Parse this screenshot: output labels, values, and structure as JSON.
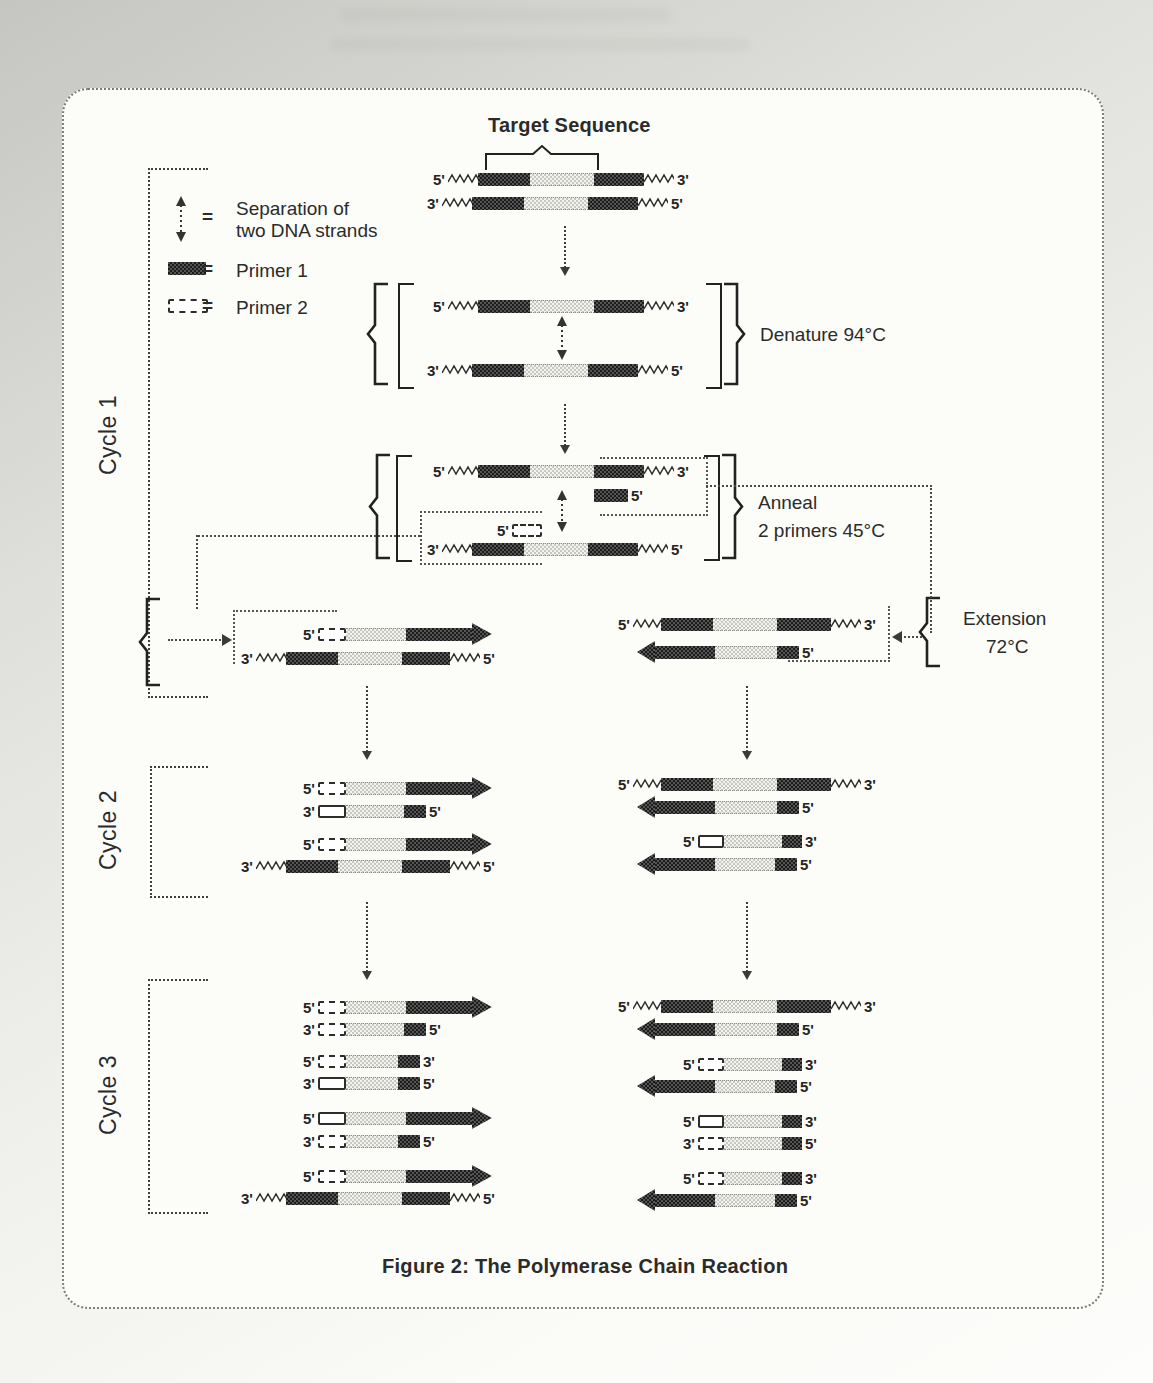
{
  "figure": {
    "target_label": "Target Sequence",
    "caption": "Figure 2: The Polymerase Chain Reaction",
    "cycles": [
      "Cycle 1",
      "Cycle 2",
      "Cycle 3"
    ],
    "steps": {
      "denature": "Denature 94°C",
      "anneal_line1": "Anneal",
      "anneal_line2": "2 primers 45°C",
      "extension_line1": "Extension",
      "extension_line2": "72°C"
    },
    "legend": {
      "equals": "=",
      "items": [
        {
          "icon": "separation-arrows-icon",
          "label_line1": "Separation of",
          "label_line2": "two DNA strands"
        },
        {
          "icon": "primer1-swatch",
          "label_line1": "Primer 1",
          "label_line2": ""
        },
        {
          "icon": "primer2-swatch",
          "label_line1": "Primer 2",
          "label_line2": ""
        }
      ]
    },
    "strand_end_labels": {
      "five_prime": "5'",
      "three_prime": "3'"
    },
    "colors": {
      "ink": "#2b2b2b",
      "dark_fill": "#1c1c1c",
      "dark_alt": "#555555",
      "light_fill": "#c8c8c3",
      "panel_bg": "#fcfcf9",
      "page_bg": "#c5c6c1"
    }
  },
  "strands": [
    {
      "x": 430,
      "y": 170,
      "parts": [
        [
          "lbl",
          "5'"
        ],
        [
          "zig",
          30
        ],
        [
          "dark",
          52
        ],
        [
          "light",
          64
        ],
        [
          "dark",
          50
        ],
        [
          "zig",
          30
        ],
        [
          "lbl",
          "3'"
        ]
      ]
    },
    {
      "x": 424,
      "y": 194,
      "parts": [
        [
          "lbl",
          "3'"
        ],
        [
          "zig",
          30
        ],
        [
          "dark",
          52
        ],
        [
          "light",
          64
        ],
        [
          "dark",
          50
        ],
        [
          "zig",
          30
        ],
        [
          "lbl",
          "5'"
        ]
      ]
    },
    {
      "x": 430,
      "y": 297,
      "parts": [
        [
          "lbl",
          "5'"
        ],
        [
          "zig",
          30
        ],
        [
          "dark",
          52
        ],
        [
          "light",
          64
        ],
        [
          "dark",
          50
        ],
        [
          "zig",
          30
        ],
        [
          "lbl",
          "3'"
        ]
      ]
    },
    {
      "x": 424,
      "y": 361,
      "parts": [
        [
          "lbl",
          "3'"
        ],
        [
          "zig",
          30
        ],
        [
          "dark",
          52
        ],
        [
          "light",
          64
        ],
        [
          "dark",
          50
        ],
        [
          "zig",
          30
        ],
        [
          "lbl",
          "5'"
        ]
      ]
    },
    {
      "x": 430,
      "y": 462,
      "parts": [
        [
          "lbl",
          "5'"
        ],
        [
          "zig",
          30
        ],
        [
          "dark",
          52
        ],
        [
          "light",
          64
        ],
        [
          "dark",
          50
        ],
        [
          "zig",
          30
        ],
        [
          "lbl",
          "3'"
        ]
      ]
    },
    {
      "x": 594,
      "y": 486,
      "parts": [
        [
          "p1",
          34
        ],
        [
          "lbl",
          "5'"
        ]
      ]
    },
    {
      "x": 494,
      "y": 521,
      "parts": [
        [
          "lbl",
          "5'"
        ],
        [
          "p2",
          26,
          "dashed"
        ]
      ]
    },
    {
      "x": 424,
      "y": 540,
      "parts": [
        [
          "lbl",
          "3'"
        ],
        [
          "zig",
          30
        ],
        [
          "dark",
          52
        ],
        [
          "light",
          64
        ],
        [
          "dark",
          50
        ],
        [
          "zig",
          30
        ],
        [
          "lbl",
          "5'"
        ]
      ]
    },
    {
      "x": 300,
      "y": 625,
      "parts": [
        [
          "lbl",
          "5'"
        ],
        [
          "p2",
          24,
          "dashed"
        ],
        [
          "light",
          60
        ],
        [
          "dark",
          66
        ],
        [
          "arrR",
          20
        ]
      ]
    },
    {
      "x": 238,
      "y": 649,
      "parts": [
        [
          "lbl",
          "3'"
        ],
        [
          "zig",
          30
        ],
        [
          "dark",
          52
        ],
        [
          "light",
          64
        ],
        [
          "dark",
          48
        ],
        [
          "zig",
          30
        ],
        [
          "lbl",
          "5'"
        ]
      ]
    },
    {
      "x": 615,
      "y": 615,
      "parts": [
        [
          "lbl",
          "5'"
        ],
        [
          "zig",
          28
        ],
        [
          "dark",
          52
        ],
        [
          "light",
          64
        ],
        [
          "dark",
          54
        ],
        [
          "zig",
          30
        ],
        [
          "lbl",
          "3'"
        ]
      ]
    },
    {
      "x": 637,
      "y": 643,
      "parts": [
        [
          "arrL",
          18
        ],
        [
          "dark",
          60
        ],
        [
          "light",
          62
        ],
        [
          "p1",
          22
        ],
        [
          "lbl",
          "5'"
        ]
      ]
    },
    {
      "x": 300,
      "y": 779,
      "parts": [
        [
          "lbl",
          "5'"
        ],
        [
          "p2",
          24,
          "dashed"
        ],
        [
          "light",
          60
        ],
        [
          "dark",
          66
        ],
        [
          "arrR",
          20
        ]
      ]
    },
    {
      "x": 300,
      "y": 802,
      "parts": [
        [
          "lbl",
          "3'"
        ],
        [
          "p2",
          24,
          "solid"
        ],
        [
          "light",
          58
        ],
        [
          "p1",
          22
        ],
        [
          "lbl",
          "5'"
        ]
      ]
    },
    {
      "x": 300,
      "y": 835,
      "parts": [
        [
          "lbl",
          "5'"
        ],
        [
          "p2",
          24,
          "dashed"
        ],
        [
          "light",
          60
        ],
        [
          "dark",
          66
        ],
        [
          "arrR",
          20
        ]
      ]
    },
    {
      "x": 238,
      "y": 857,
      "parts": [
        [
          "lbl",
          "3'"
        ],
        [
          "zig",
          30
        ],
        [
          "dark",
          52
        ],
        [
          "light",
          64
        ],
        [
          "dark",
          48
        ],
        [
          "zig",
          30
        ],
        [
          "lbl",
          "5'"
        ]
      ]
    },
    {
      "x": 615,
      "y": 775,
      "parts": [
        [
          "lbl",
          "5'"
        ],
        [
          "zig",
          28
        ],
        [
          "dark",
          52
        ],
        [
          "light",
          64
        ],
        [
          "dark",
          54
        ],
        [
          "zig",
          30
        ],
        [
          "lbl",
          "3'"
        ]
      ]
    },
    {
      "x": 637,
      "y": 798,
      "parts": [
        [
          "arrL",
          18
        ],
        [
          "dark",
          60
        ],
        [
          "light",
          62
        ],
        [
          "p1",
          22
        ],
        [
          "lbl",
          "5'"
        ]
      ]
    },
    {
      "x": 680,
      "y": 832,
      "parts": [
        [
          "lbl",
          "5'"
        ],
        [
          "p2",
          22,
          "solid"
        ],
        [
          "light",
          58
        ],
        [
          "p1",
          20
        ],
        [
          "lbl",
          "3'"
        ]
      ]
    },
    {
      "x": 637,
      "y": 855,
      "parts": [
        [
          "arrL",
          18
        ],
        [
          "dark",
          60
        ],
        [
          "light",
          60
        ],
        [
          "p1",
          22
        ],
        [
          "lbl",
          "5'"
        ]
      ]
    },
    {
      "x": 300,
      "y": 998,
      "parts": [
        [
          "lbl",
          "5'"
        ],
        [
          "p2",
          24,
          "dashed"
        ],
        [
          "light",
          60
        ],
        [
          "dark",
          66
        ],
        [
          "arrR",
          20
        ]
      ]
    },
    {
      "x": 300,
      "y": 1020,
      "parts": [
        [
          "lbl",
          "3'"
        ],
        [
          "p2",
          24,
          "dashed"
        ],
        [
          "light",
          58
        ],
        [
          "p1",
          22
        ],
        [
          "lbl",
          "5'"
        ]
      ]
    },
    {
      "x": 300,
      "y": 1052,
      "parts": [
        [
          "lbl",
          "5'"
        ],
        [
          "p2",
          24,
          "dashed"
        ],
        [
          "light",
          52
        ],
        [
          "p1",
          22
        ],
        [
          "lbl",
          "3'"
        ]
      ]
    },
    {
      "x": 300,
      "y": 1074,
      "parts": [
        [
          "lbl",
          "3'"
        ],
        [
          "p2",
          24,
          "solid"
        ],
        [
          "light",
          52
        ],
        [
          "p1",
          22
        ],
        [
          "lbl",
          "5'"
        ]
      ]
    },
    {
      "x": 300,
      "y": 1109,
      "parts": [
        [
          "lbl",
          "5'"
        ],
        [
          "p2",
          24,
          "solid"
        ],
        [
          "light",
          60
        ],
        [
          "dark",
          66
        ],
        [
          "arrR",
          20
        ]
      ]
    },
    {
      "x": 300,
      "y": 1132,
      "parts": [
        [
          "lbl",
          "3'"
        ],
        [
          "p2",
          24,
          "dashed"
        ],
        [
          "light",
          52
        ],
        [
          "p1",
          22
        ],
        [
          "lbl",
          "5'"
        ]
      ]
    },
    {
      "x": 300,
      "y": 1167,
      "parts": [
        [
          "lbl",
          "5'"
        ],
        [
          "p2",
          24,
          "dashed"
        ],
        [
          "light",
          60
        ],
        [
          "dark",
          66
        ],
        [
          "arrR",
          20
        ]
      ]
    },
    {
      "x": 238,
      "y": 1189,
      "parts": [
        [
          "lbl",
          "3'"
        ],
        [
          "zig",
          30
        ],
        [
          "dark",
          52
        ],
        [
          "light",
          64
        ],
        [
          "dark",
          48
        ],
        [
          "zig",
          30
        ],
        [
          "lbl",
          "5'"
        ]
      ]
    },
    {
      "x": 615,
      "y": 997,
      "parts": [
        [
          "lbl",
          "5'"
        ],
        [
          "zig",
          28
        ],
        [
          "dark",
          52
        ],
        [
          "light",
          64
        ],
        [
          "dark",
          54
        ],
        [
          "zig",
          30
        ],
        [
          "lbl",
          "3'"
        ]
      ]
    },
    {
      "x": 637,
      "y": 1020,
      "parts": [
        [
          "arrL",
          18
        ],
        [
          "dark",
          60
        ],
        [
          "light",
          62
        ],
        [
          "p1",
          22
        ],
        [
          "lbl",
          "5'"
        ]
      ]
    },
    {
      "x": 680,
      "y": 1055,
      "parts": [
        [
          "lbl",
          "5'"
        ],
        [
          "p2",
          22,
          "dashed"
        ],
        [
          "light",
          58
        ],
        [
          "p1",
          20
        ],
        [
          "lbl",
          "3'"
        ]
      ]
    },
    {
      "x": 637,
      "y": 1077,
      "parts": [
        [
          "arrL",
          18
        ],
        [
          "dark",
          60
        ],
        [
          "light",
          60
        ],
        [
          "p1",
          22
        ],
        [
          "lbl",
          "5'"
        ]
      ]
    },
    {
      "x": 680,
      "y": 1112,
      "parts": [
        [
          "lbl",
          "5'"
        ],
        [
          "p2",
          22,
          "solid"
        ],
        [
          "light",
          58
        ],
        [
          "p1",
          20
        ],
        [
          "lbl",
          "3'"
        ]
      ]
    },
    {
      "x": 680,
      "y": 1134,
      "parts": [
        [
          "lbl",
          "3'"
        ],
        [
          "p2",
          22,
          "dashed"
        ],
        [
          "light",
          58
        ],
        [
          "p1",
          20
        ],
        [
          "lbl",
          "5'"
        ]
      ]
    },
    {
      "x": 680,
      "y": 1169,
      "parts": [
        [
          "lbl",
          "5'"
        ],
        [
          "p2",
          22,
          "dashed"
        ],
        [
          "light",
          58
        ],
        [
          "p1",
          20
        ],
        [
          "lbl",
          "3'"
        ]
      ]
    },
    {
      "x": 637,
      "y": 1191,
      "parts": [
        [
          "arrL",
          18
        ],
        [
          "dark",
          60
        ],
        [
          "light",
          60
        ],
        [
          "p1",
          22
        ],
        [
          "lbl",
          "5'"
        ]
      ]
    }
  ]
}
